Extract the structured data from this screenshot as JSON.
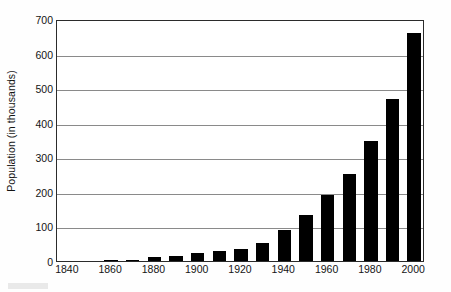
{
  "chart_data": {
    "type": "bar",
    "title": "",
    "xlabel": "",
    "ylabel": "Population (in thousands)",
    "categories": [
      1840,
      1850,
      1860,
      1870,
      1880,
      1890,
      1900,
      1910,
      1920,
      1930,
      1940,
      1950,
      1960,
      1970,
      1980,
      1990,
      2000
    ],
    "values": [
      0,
      1,
      2,
      4,
      11,
      14,
      22,
      30,
      36,
      53,
      89,
      133,
      190,
      253,
      348,
      468,
      660
    ],
    "x_tick_labels": [
      "1840",
      "1860",
      "1880",
      "1900",
      "1920",
      "1940",
      "1960",
      "1980",
      "2000"
    ],
    "x_tick_values": [
      1840,
      1860,
      1880,
      1900,
      1920,
      1940,
      1960,
      1980,
      2000
    ],
    "y_tick_labels": [
      "0",
      "100",
      "200",
      "300",
      "400",
      "500",
      "600",
      "700"
    ],
    "y_tick_values": [
      0,
      100,
      200,
      300,
      400,
      500,
      600,
      700
    ],
    "ylim": [
      0,
      700
    ],
    "xlim": [
      1835,
      2005
    ],
    "grid": "horizontal",
    "legend": "none",
    "bar_color": "#000000",
    "gridline_color": "#8a8a8a",
    "axis_color": "#2b2b2b"
  }
}
